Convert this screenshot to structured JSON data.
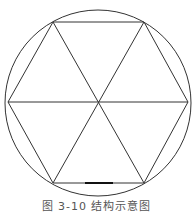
{
  "figure": {
    "type": "hexagon-in-circle",
    "circle": {
      "cx": 98,
      "cy": 103,
      "r": 93
    },
    "vertices": [
      {
        "x": 8,
        "y": 102
      },
      {
        "x": 53,
        "y": 22
      },
      {
        "x": 144,
        "y": 22
      },
      {
        "x": 188,
        "y": 102
      },
      {
        "x": 144,
        "y": 183
      },
      {
        "x": 53,
        "y": 183
      }
    ],
    "center": {
      "x": 98,
      "y": 102
    },
    "highlight_segment": {
      "x1": 85,
      "y1": 183,
      "x2": 113,
      "y2": 183
    },
    "stroke_color": "#333333"
  },
  "caption": {
    "text": "图 3-10 结构示意图"
  }
}
